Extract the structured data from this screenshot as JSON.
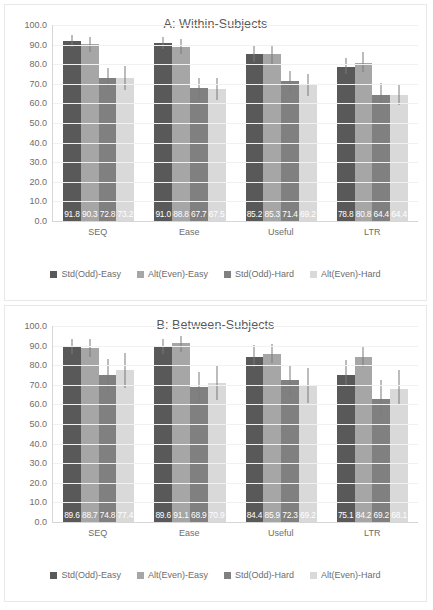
{
  "chart_data": [
    {
      "type": "bar",
      "panel": "A",
      "title": "A: Within-Subjects",
      "categories": [
        "SEQ",
        "Ease",
        "Useful",
        "LTR"
      ],
      "xlabel": "",
      "ylabel": "",
      "ylim": [
        0,
        100
      ],
      "ytick_labels": [
        "0.0",
        "10.0",
        "20.0",
        "30.0",
        "40.0",
        "50.0",
        "60.0",
        "70.0",
        "80.0",
        "90.0",
        "100.0"
      ],
      "ytick_values": [
        0,
        10,
        20,
        30,
        40,
        50,
        60,
        70,
        80,
        90,
        100
      ],
      "grid": true,
      "legend_position": "bottom",
      "series": [
        {
          "name": "Std(Odd)-Easy",
          "color": "#595959",
          "values": [
            91.8,
            91.0,
            85.2,
            78.8
          ],
          "labels": [
            "91.8",
            "91.0",
            "85.2",
            "78.8"
          ],
          "err_low": [
            88.8,
            88.0,
            81.2,
            74.8
          ],
          "err_high": [
            94.8,
            94.0,
            89.2,
            83.2
          ]
        },
        {
          "name": "Alt(Even)-Easy",
          "color": "#a6a6a6",
          "values": [
            90.3,
            88.8,
            85.3,
            80.8
          ],
          "labels": [
            "90.3",
            "88.8",
            "85.3",
            "80.8"
          ],
          "err_low": [
            86.3,
            85.0,
            80.3,
            75.8
          ],
          "err_high": [
            94.0,
            93.0,
            90.0,
            86.0
          ]
        },
        {
          "name": "Std(Odd)-Hard",
          "color": "#808080",
          "values": [
            72.8,
            67.7,
            71.4,
            64.4
          ],
          "labels": [
            "72.8",
            "67.7",
            "71.4",
            "64.4"
          ],
          "err_low": [
            67.5,
            62.5,
            66.0,
            59.5
          ],
          "err_high": [
            78.2,
            73.2,
            76.6,
            70.5
          ]
        },
        {
          "name": "Alt(Even)-Hard",
          "color": "#d9d9d9",
          "values": [
            73.2,
            67.5,
            69.2,
            64.4
          ],
          "labels": [
            "73.2",
            "67.5",
            "69.2",
            "64.4"
          ],
          "err_low": [
            67.0,
            61.8,
            63.8,
            59.0
          ],
          "err_high": [
            79.0,
            73.0,
            74.8,
            70.0
          ]
        }
      ]
    },
    {
      "type": "bar",
      "panel": "B",
      "title": "B: Between-Subjects",
      "categories": [
        "SEQ",
        "Ease",
        "Useful",
        "LTR"
      ],
      "xlabel": "",
      "ylabel": "",
      "ylim": [
        0,
        100
      ],
      "ytick_labels": [
        "0.0",
        "10.0",
        "20.0",
        "30.0",
        "40.0",
        "50.0",
        "60.0",
        "70.0",
        "80.0",
        "90.0",
        "100.0"
      ],
      "ytick_values": [
        0,
        10,
        20,
        30,
        40,
        50,
        60,
        70,
        80,
        90,
        100
      ],
      "grid": true,
      "legend_position": "bottom",
      "series": [
        {
          "name": "Std(Odd)-Easy",
          "color": "#595959",
          "values": [
            89.6,
            89.6,
            84.4,
            75.1
          ],
          "labels": [
            "89.6",
            "89.6",
            "84.4",
            "75.1"
          ],
          "err_low": [
            85.8,
            85.8,
            79.0,
            69.5
          ],
          "err_high": [
            93.5,
            93.5,
            90.2,
            82.5
          ]
        },
        {
          "name": "Alt(Even)-Easy",
          "color": "#a6a6a6",
          "values": [
            88.7,
            91.1,
            85.9,
            84.2
          ],
          "labels": [
            "88.7",
            "91.1",
            "85.9",
            "84.2"
          ],
          "err_low": [
            84.0,
            86.8,
            81.2,
            79.0
          ],
          "err_high": [
            93.2,
            95.0,
            90.8,
            90.0
          ]
        },
        {
          "name": "Std(Odd)-Hard",
          "color": "#808080",
          "values": [
            74.8,
            68.9,
            72.3,
            63.0
          ],
          "labels": [
            "74.8",
            "68.9",
            "72.3",
            "69.2"
          ],
          "err_low": [
            66.2,
            61.2,
            64.2,
            54.2
          ],
          "err_high": [
            83.2,
            76.5,
            80.2,
            72.5
          ]
        },
        {
          "name": "Alt(Even)-Hard",
          "color": "#d9d9d9",
          "values": [
            77.4,
            70.9,
            69.2,
            68.1
          ],
          "labels": [
            "77.4",
            "70.9",
            "69.2",
            "68.1"
          ],
          "err_low": [
            68.5,
            62.2,
            60.8,
            59.5
          ],
          "err_high": [
            86.0,
            80.2,
            78.5,
            77.5
          ]
        }
      ]
    }
  ]
}
